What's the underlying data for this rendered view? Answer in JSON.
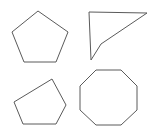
{
  "canvas": {
    "width": 148,
    "height": 128,
    "background_color": "#ffffff",
    "stroke_color": "#5a5a5a",
    "fill_color": "#ffffff",
    "stroke_width": 1
  },
  "figure": {
    "shape_count": 4
  },
  "shapes": [
    {
      "id": "shape-top-left",
      "name": "pentagon-regular",
      "label": "Regular pentagon",
      "position": "top-left",
      "sides": 5,
      "convex": true,
      "points": "38,11 68,32 56,62 24,62 12,32",
      "vertices": [
        [
          38,
          11
        ],
        [
          68,
          32
        ],
        [
          56,
          62
        ],
        [
          24,
          62
        ],
        [
          12,
          32
        ]
      ],
      "bbox": [
        12,
        11,
        68,
        62
      ]
    },
    {
      "id": "shape-top-right",
      "name": "concave-quadrilateral",
      "label": "Concave arrow-like quadrilateral",
      "position": "top-right",
      "sides": 4,
      "convex": false,
      "points": "89,12 147,13 101,44 91,60",
      "vertices": [
        [
          89,
          12
        ],
        [
          147,
          13
        ],
        [
          101,
          44
        ],
        [
          91,
          60
        ]
      ],
      "bbox": [
        89,
        12,
        147,
        60
      ]
    },
    {
      "id": "shape-bottom-left",
      "name": "pentagon-irregular",
      "label": "Irregular tilted pentagon",
      "position": "bottom-left",
      "sides": 5,
      "convex": true,
      "points": "52,79 66,105 56,124 23,124 14,102",
      "vertices": [
        [
          52,
          79
        ],
        [
          66,
          105
        ],
        [
          56,
          124
        ],
        [
          23,
          124
        ],
        [
          14,
          102
        ]
      ],
      "bbox": [
        14,
        79,
        66,
        124
      ]
    },
    {
      "id": "shape-bottom-right",
      "name": "octagon-regular",
      "label": "Regular octagon",
      "position": "bottom-right",
      "sides": 8,
      "convex": true,
      "points": "96,70 121,70 137,86 137,110 121,125 96,125 80,110 80,86",
      "vertices": [
        [
          96,
          70
        ],
        [
          121,
          70
        ],
        [
          137,
          86
        ],
        [
          137,
          110
        ],
        [
          121,
          125
        ],
        [
          96,
          125
        ],
        [
          80,
          110
        ],
        [
          80,
          86
        ]
      ],
      "bbox": [
        80,
        70,
        137,
        125
      ]
    }
  ]
}
